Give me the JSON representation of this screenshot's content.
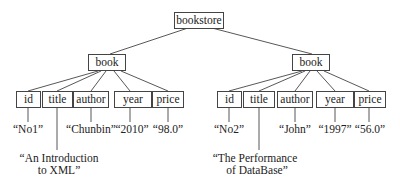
{
  "root": {
    "label": "bookstore"
  },
  "books": [
    {
      "label": "book",
      "fields": [
        {
          "name": "id",
          "value": "“No1”"
        },
        {
          "name": "title",
          "value_line1": "“An Introduction",
          "value_line2": "to XML”"
        },
        {
          "name": "author",
          "value": "“Chunbin”"
        },
        {
          "name": "year",
          "value": "“2010”"
        },
        {
          "name": "price",
          "value": "“98.0”"
        }
      ]
    },
    {
      "label": "book",
      "fields": [
        {
          "name": "id",
          "value": "“No2”"
        },
        {
          "name": "title",
          "value_line1": "“The Performance",
          "value_line2": "of DataBase”"
        },
        {
          "name": "author",
          "value": "“John”"
        },
        {
          "name": "year",
          "value": "“1997”"
        },
        {
          "name": "price",
          "value": "“56.0”"
        }
      ]
    }
  ]
}
